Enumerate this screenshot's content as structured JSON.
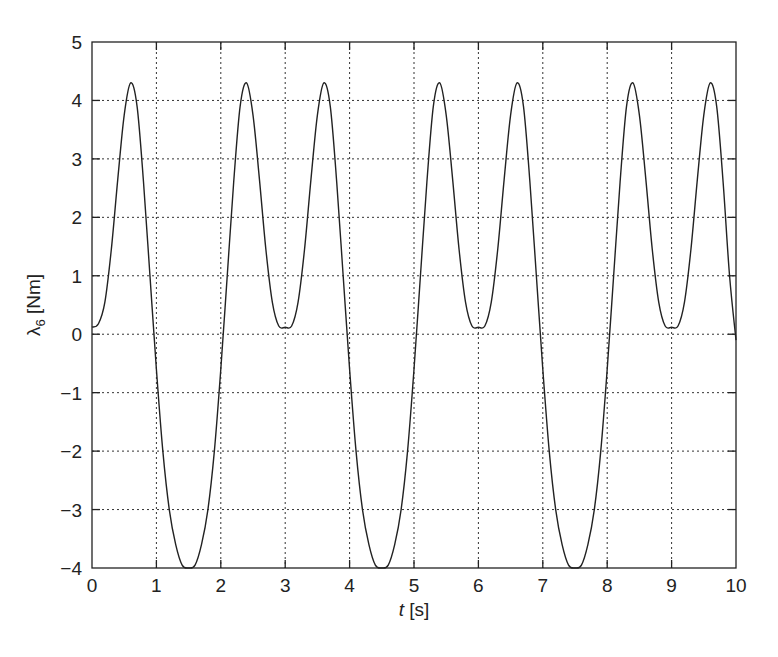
{
  "chart_data": {
    "type": "line",
    "title": "",
    "xlabel": "t [s]",
    "xlabel_var": "t",
    "xlabel_unit": " [s]",
    "ylabel": "λ6 [Nm]",
    "ylabel_var": "λ",
    "ylabel_sub": "6",
    "ylabel_unit": " [Nm]",
    "xlim": [
      0,
      10
    ],
    "ylim": [
      -4,
      5
    ],
    "xticks": [
      0,
      1,
      2,
      3,
      4,
      5,
      6,
      7,
      8,
      9,
      10
    ],
    "xtick_labels": [
      "0",
      "1",
      "2",
      "3",
      "4",
      "5",
      "6",
      "7",
      "8",
      "9",
      "10"
    ],
    "yticks": [
      -4,
      -3,
      -2,
      -1,
      0,
      1,
      2,
      3,
      4,
      5
    ],
    "ytick_labels": [
      "−4",
      "−3",
      "−2",
      "−1",
      "0",
      "1",
      "2",
      "3",
      "4",
      "5"
    ],
    "grid": true,
    "legend": null,
    "series": [
      {
        "name": "lambda_6",
        "color": "#222222",
        "x": [
          0.0,
          0.1,
          0.2,
          0.3,
          0.4,
          0.5,
          0.6,
          0.7,
          0.8,
          0.9,
          1.0,
          1.1,
          1.2,
          1.3,
          1.4,
          1.5,
          1.6,
          1.7,
          1.8,
          1.9,
          2.0,
          2.1,
          2.2,
          2.3,
          2.4,
          2.5,
          2.6,
          2.7,
          2.8,
          2.9,
          3.0,
          3.1,
          3.2,
          3.3,
          3.4,
          3.5,
          3.6,
          3.7,
          3.8,
          3.9,
          4.0,
          4.1,
          4.2,
          4.3,
          4.4,
          4.5,
          4.6,
          4.7,
          4.8,
          4.9,
          5.0,
          5.1,
          5.2,
          5.3,
          5.4,
          5.5,
          5.6,
          5.7,
          5.8,
          5.9,
          6.0,
          6.1,
          6.2,
          6.3,
          6.4,
          6.5,
          6.6,
          6.7,
          6.8,
          6.9,
          7.0,
          7.1,
          7.2,
          7.3,
          7.4,
          7.5,
          7.6,
          7.7,
          7.8,
          7.9,
          8.0,
          8.1,
          8.2,
          8.3,
          8.4,
          8.5,
          8.6,
          8.7,
          8.8,
          8.9,
          9.0,
          9.1,
          9.2,
          9.3,
          9.4,
          9.5,
          9.6,
          9.7,
          9.8,
          9.9,
          10.0
        ],
        "y": [
          0.12,
          0.18,
          0.55,
          1.45,
          2.65,
          3.75,
          4.3,
          3.9,
          2.6,
          1.0,
          -0.6,
          -2.0,
          -3.0,
          -3.6,
          -3.95,
          -4.0,
          -3.95,
          -3.6,
          -3.0,
          -2.0,
          -0.6,
          1.0,
          2.6,
          3.9,
          4.3,
          3.75,
          2.65,
          1.45,
          0.55,
          0.14,
          0.12,
          0.14,
          0.55,
          1.45,
          2.65,
          3.75,
          4.3,
          3.9,
          2.6,
          1.0,
          -0.6,
          -2.0,
          -3.0,
          -3.6,
          -3.95,
          -4.0,
          -3.95,
          -3.6,
          -3.0,
          -2.0,
          -0.6,
          1.0,
          2.6,
          3.9,
          4.3,
          3.75,
          2.65,
          1.45,
          0.55,
          0.14,
          0.12,
          0.14,
          0.55,
          1.45,
          2.65,
          3.75,
          4.3,
          3.9,
          2.6,
          1.0,
          -0.6,
          -2.0,
          -3.0,
          -3.6,
          -3.95,
          -4.0,
          -3.95,
          -3.6,
          -3.0,
          -2.0,
          -0.6,
          1.0,
          2.6,
          3.9,
          4.3,
          3.75,
          2.65,
          1.45,
          0.55,
          0.14,
          0.12,
          0.14,
          0.55,
          1.45,
          2.65,
          3.75,
          4.3,
          3.9,
          2.6,
          1.0,
          -0.1
        ]
      }
    ]
  },
  "layout": {
    "plot_left": 92,
    "plot_top": 42,
    "plot_right": 736,
    "plot_bottom": 568
  }
}
